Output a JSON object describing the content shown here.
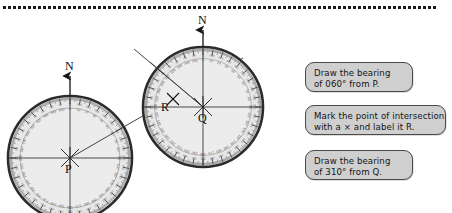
{
  "page": {
    "width": 452,
    "height": 213,
    "background": "#ffffff",
    "divider": {
      "style": "dotted",
      "color": "#1a1a1a"
    }
  },
  "colors": {
    "callout_fill": "#cfcfcf",
    "callout_border": "#4a4a4a",
    "protractor_fill": "#e6e6e6",
    "protractor_rim": "#2b2b2b",
    "ink": "#141414",
    "scale_text": "#555555"
  },
  "callouts": [
    {
      "id": "draw-bearing-060",
      "line1": "Draw the bearing",
      "line2": "of 060° from P."
    },
    {
      "id": "mark-intersection",
      "line1": "Mark the point of intersection",
      "line2": "with a × and label it R."
    },
    {
      "id": "draw-bearing-310",
      "line1": "Draw the bearing",
      "line2": "of 310° from Q."
    }
  ],
  "protractors": [
    {
      "id": "protractor-p",
      "center_label": "P",
      "north_label": "N",
      "cx": 70,
      "cy": 158,
      "radius": 62,
      "bearing_drawn": 60,
      "bearing_text": "060°"
    },
    {
      "id": "protractor-q",
      "center_label": "Q",
      "north_label": "N",
      "cx": 203,
      "cy": 107,
      "radius": 60,
      "bearing_drawn": 310,
      "bearing_text": "310°"
    }
  ],
  "intersection": {
    "label": "R",
    "x": 173,
    "y": 99,
    "marker": "cross"
  },
  "scale_numbers_sample": [
    "0",
    "10",
    "20",
    "30",
    "40",
    "50",
    "60",
    "70",
    "80",
    "90",
    "100",
    "110",
    "120",
    "130",
    "140",
    "150",
    "160",
    "170",
    "180",
    "190",
    "200",
    "210",
    "220",
    "230",
    "240",
    "250",
    "260",
    "270",
    "280",
    "290",
    "300",
    "310",
    "320",
    "330",
    "340",
    "350"
  ]
}
